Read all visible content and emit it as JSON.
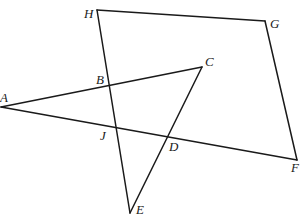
{
  "figure": {
    "type": "geometry-diagram",
    "points": {
      "A": {
        "x": 1,
        "y": 107
      },
      "B": {
        "x": 108,
        "y": 86
      },
      "C": {
        "x": 202,
        "y": 67
      },
      "D": {
        "x": 168,
        "y": 136
      },
      "E": {
        "x": 130,
        "y": 213
      },
      "F": {
        "x": 297,
        "y": 160
      },
      "G": {
        "x": 265,
        "y": 21
      },
      "H": {
        "x": 97,
        "y": 10
      },
      "J": {
        "x": 115,
        "y": 128
      }
    },
    "segments": [
      [
        "A",
        "C"
      ],
      [
        "A",
        "F"
      ],
      [
        "C",
        "E"
      ],
      [
        "H",
        "G"
      ],
      [
        "G",
        "F"
      ],
      [
        "H",
        "E"
      ]
    ],
    "labels": [
      {
        "text": "H",
        "x": 84,
        "y": 18
      },
      {
        "text": "G",
        "x": 270,
        "y": 28
      },
      {
        "text": "C",
        "x": 205,
        "y": 66
      },
      {
        "text": "B",
        "x": 96,
        "y": 84
      },
      {
        "text": "A",
        "x": 0,
        "y": 102
      },
      {
        "text": "J",
        "x": 100,
        "y": 140
      },
      {
        "text": "D",
        "x": 169,
        "y": 151
      },
      {
        "text": "F",
        "x": 291,
        "y": 172
      },
      {
        "text": "E",
        "x": 136,
        "y": 214
      }
    ]
  }
}
